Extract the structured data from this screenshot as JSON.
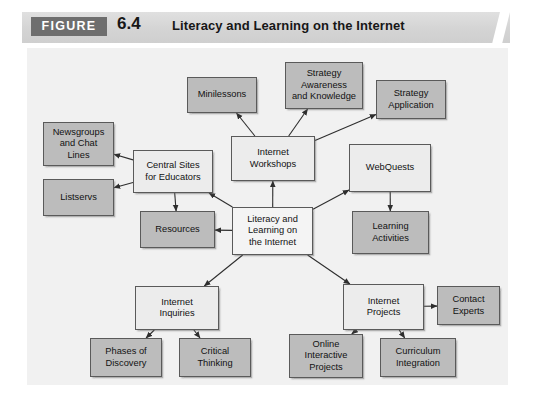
{
  "header": {
    "figure_tag": "FIGURE",
    "figure_number": "6.4",
    "title": "Literacy and Learning on the Internet",
    "tag_bg": "#6e6e6e",
    "band_bg": "#d4d4d4"
  },
  "diagram": {
    "background": "#f1f1f1",
    "node_border": "#5a5a5a",
    "shade_light": "#ececec",
    "shade_medium": "#bcbcbc",
    "nodes": [
      {
        "id": "minilessons",
        "label": "Minilessons",
        "shade": "medium",
        "x": 160,
        "y": 29,
        "w": 70,
        "h": 36
      },
      {
        "id": "strategy-awareness",
        "label": "Strategy\nAwareness\nand Knowledge",
        "shade": "medium",
        "x": 258,
        "y": 14,
        "w": 78,
        "h": 47
      },
      {
        "id": "strategy-application",
        "label": "Strategy\nApplication",
        "shade": "medium",
        "x": 349,
        "y": 32,
        "w": 70,
        "h": 39
      },
      {
        "id": "newsgroups",
        "label": "Newsgroups\nand Chat\nLines",
        "shade": "medium",
        "x": 16,
        "y": 74,
        "w": 71,
        "h": 44
      },
      {
        "id": "listservs",
        "label": "Listservs",
        "shade": "medium",
        "x": 16,
        "y": 131,
        "w": 71,
        "h": 37
      },
      {
        "id": "central-sites",
        "label": "Central Sites\nfor Educators",
        "shade": "light",
        "x": 106,
        "y": 102,
        "w": 80,
        "h": 43
      },
      {
        "id": "internet-workshops",
        "label": "Internet\nWorkshops",
        "shade": "light",
        "x": 204,
        "y": 88,
        "w": 84,
        "h": 45
      },
      {
        "id": "webquests",
        "label": "WebQuests",
        "shade": "light",
        "x": 322,
        "y": 96,
        "w": 82,
        "h": 48
      },
      {
        "id": "resources",
        "label": "Resources",
        "shade": "medium",
        "x": 113,
        "y": 163,
        "w": 75,
        "h": 37
      },
      {
        "id": "literacy-center",
        "label": "Literacy and\nLearning on\nthe Internet",
        "shade": "center",
        "x": 205,
        "y": 159,
        "w": 81,
        "h": 48
      },
      {
        "id": "learning-activities",
        "label": "Learning\nActivities",
        "shade": "medium",
        "x": 325,
        "y": 163,
        "w": 77,
        "h": 43
      },
      {
        "id": "internet-inquiries",
        "label": "Internet\nInquiries",
        "shade": "light",
        "x": 108,
        "y": 238,
        "w": 84,
        "h": 44
      },
      {
        "id": "internet-projects",
        "label": "Internet\nProjects",
        "shade": "light",
        "x": 316,
        "y": 236,
        "w": 81,
        "h": 46
      },
      {
        "id": "contact-experts",
        "label": "Contact\nExperts",
        "shade": "medium",
        "x": 410,
        "y": 238,
        "w": 63,
        "h": 39
      },
      {
        "id": "phases-discovery",
        "label": "Phases of\nDiscovery",
        "shade": "medium",
        "x": 63,
        "y": 290,
        "w": 72,
        "h": 39
      },
      {
        "id": "critical-thinking",
        "label": "Critical\nThinking",
        "shade": "medium",
        "x": 152,
        "y": 290,
        "w": 72,
        "h": 39
      },
      {
        "id": "online-interactive",
        "label": "Online\nInteractive\nProjects",
        "shade": "medium",
        "x": 262,
        "y": 286,
        "w": 74,
        "h": 44
      },
      {
        "id": "curriculum-integration",
        "label": "Curriculum\nIntegration",
        "shade": "medium",
        "x": 353,
        "y": 290,
        "w": 76,
        "h": 39
      }
    ],
    "connectors": [
      {
        "from": "literacy-center",
        "to": "internet-workshops"
      },
      {
        "from": "literacy-center",
        "to": "webquests"
      },
      {
        "from": "literacy-center",
        "to": "central-sites"
      },
      {
        "from": "literacy-center",
        "to": "resources"
      },
      {
        "from": "literacy-center",
        "to": "internet-inquiries"
      },
      {
        "from": "literacy-center",
        "to": "internet-projects"
      },
      {
        "from": "internet-workshops",
        "to": "minilessons"
      },
      {
        "from": "internet-workshops",
        "to": "strategy-awareness"
      },
      {
        "from": "internet-workshops",
        "to": "strategy-application"
      },
      {
        "from": "central-sites",
        "to": "newsgroups"
      },
      {
        "from": "central-sites",
        "to": "listservs"
      },
      {
        "from": "central-sites",
        "to": "resources"
      },
      {
        "from": "webquests",
        "to": "learning-activities"
      },
      {
        "from": "internet-inquiries",
        "to": "phases-discovery"
      },
      {
        "from": "internet-inquiries",
        "to": "critical-thinking"
      },
      {
        "from": "internet-projects",
        "to": "contact-experts"
      },
      {
        "from": "internet-projects",
        "to": "online-interactive"
      },
      {
        "from": "internet-projects",
        "to": "curriculum-integration"
      }
    ]
  }
}
